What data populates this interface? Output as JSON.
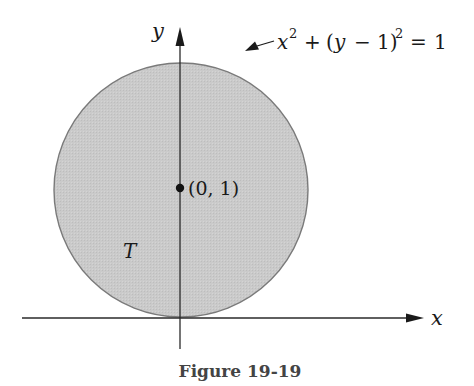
{
  "figure": {
    "caption": "Figure 19-19",
    "region_label": "T",
    "point_label": "(0, 1)",
    "equation": {
      "x_part": "x",
      "x_exp": "2",
      "plus": "+",
      "paren_open": "(",
      "y_var": "y",
      "minus": "−",
      "one": "1)",
      "y_exp": "2",
      "equals": "=",
      "rhs": "1"
    },
    "axes": {
      "x_label": "x",
      "y_label": "y"
    },
    "colors": {
      "fill": "#c8c8c8",
      "stroke": "#6e6e6e",
      "axis": "#2a2a2a",
      "text": "#1a1a1a"
    }
  }
}
